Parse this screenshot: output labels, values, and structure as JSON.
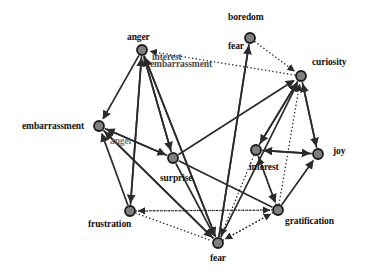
{
  "figure": {
    "type": "directed-graph",
    "title": "",
    "background_color": "#ffffff",
    "node_fill": "#808080",
    "node_stroke": "#1a1a1a",
    "edge_solid_color": "#2b2b2b",
    "edge_dotted_color": "#2b2b2b",
    "node_radius": 5.0
  },
  "nodes": [
    {
      "id": "anger",
      "label": "anger",
      "x": 142,
      "y": 50,
      "label_x": 127,
      "label_y": 33,
      "style": "normal"
    },
    {
      "id": "boredom",
      "label": "boredom",
      "x": 250,
      "y": 38,
      "label_x": 228,
      "label_y": 13,
      "style": "normal"
    },
    {
      "id": "curiosity",
      "label": "curiosity",
      "x": 301,
      "y": 76,
      "label_x": 312,
      "label_y": 58,
      "style": "normal"
    },
    {
      "id": "embarrassment",
      "label": "embarrassment",
      "x": 99,
      "y": 126,
      "label_x": 22,
      "label_y": 122,
      "style": "normal"
    },
    {
      "id": "surprise",
      "label": "surprise",
      "x": 173,
      "y": 158,
      "label_x": 160,
      "label_y": 174,
      "style": "normal"
    },
    {
      "id": "interest",
      "label": "interest",
      "x": 256,
      "y": 150,
      "label_x": 249,
      "label_y": 163,
      "style": "normal"
    },
    {
      "id": "joy",
      "label": "joy",
      "x": 318,
      "y": 154,
      "label_x": 333,
      "label_y": 147,
      "style": "normal"
    },
    {
      "id": "frustration",
      "label": "frustration",
      "x": 130,
      "y": 211,
      "label_x": 88,
      "label_y": 220,
      "style": "normal"
    },
    {
      "id": "gratification",
      "label": "gratification",
      "x": 278,
      "y": 210,
      "label_x": 285,
      "label_y": 217,
      "style": "normal"
    },
    {
      "id": "fear",
      "label": "fear",
      "x": 218,
      "y": 243,
      "label_x": 210,
      "label_y": 254,
      "style": "normal"
    }
  ],
  "overlay_labels": [
    {
      "id": "label-interest-top",
      "text": "interest",
      "x": 152,
      "y": 53,
      "style": "ghost"
    },
    {
      "id": "label-embarrassment-top",
      "text": "embarrassment",
      "x": 150,
      "y": 60,
      "style": "ghost"
    },
    {
      "id": "label-fear-top",
      "text": "fear",
      "x": 228,
      "y": 42,
      "style": "normal"
    },
    {
      "id": "label-anger-mid",
      "text": "anger",
      "x": 110,
      "y": 137,
      "style": "faded"
    }
  ],
  "edges": [
    {
      "from": "anger",
      "to": "embarrassment",
      "style": "solid",
      "arrow": "end"
    },
    {
      "from": "frustration",
      "to": "anger",
      "style": "solid",
      "arrow": "end"
    },
    {
      "from": "fear",
      "to": "anger",
      "style": "solid",
      "arrow": "end"
    },
    {
      "from": "surprise",
      "to": "anger",
      "style": "solid",
      "arrow": "end"
    },
    {
      "from": "curiosity",
      "to": "anger",
      "style": "dotted",
      "arrow": "end"
    },
    {
      "from": "anger",
      "to": "frustration",
      "style": "solid",
      "arrow": "end"
    },
    {
      "from": "anger",
      "to": "fear",
      "style": "solid",
      "arrow": "end"
    },
    {
      "from": "anger",
      "to": "surprise",
      "style": "solid",
      "arrow": "end"
    },
    {
      "from": "boredom",
      "to": "fear",
      "style": "solid",
      "arrow": "none"
    },
    {
      "from": "boredom",
      "to": "curiosity",
      "style": "dotted",
      "arrow": "end"
    },
    {
      "from": "fear",
      "to": "boredom",
      "style": "solid",
      "arrow": "end"
    },
    {
      "from": "gratification",
      "to": "curiosity",
      "style": "dotted",
      "arrow": "end"
    },
    {
      "from": "fear",
      "to": "curiosity",
      "style": "solid",
      "arrow": "end"
    },
    {
      "from": "interest",
      "to": "curiosity",
      "style": "solid",
      "arrow": "end"
    },
    {
      "from": "joy",
      "to": "curiosity",
      "style": "solid",
      "arrow": "end"
    },
    {
      "from": "surprise",
      "to": "curiosity",
      "style": "solid",
      "arrow": "end"
    },
    {
      "from": "embarrassment",
      "to": "surprise",
      "style": "solid",
      "arrow": "end"
    },
    {
      "from": "surprise",
      "to": "embarrassment",
      "style": "solid",
      "arrow": "end"
    },
    {
      "from": "fear",
      "to": "embarrassment",
      "style": "solid",
      "arrow": "end"
    },
    {
      "from": "frustration",
      "to": "embarrassment",
      "style": "solid",
      "arrow": "end"
    },
    {
      "from": "embarrassment",
      "to": "fear",
      "style": "solid",
      "arrow": "end"
    },
    {
      "from": "surprise",
      "to": "fear",
      "style": "solid",
      "arrow": "end"
    },
    {
      "from": "frustration",
      "to": "fear",
      "style": "dotted",
      "arrow": "none"
    },
    {
      "from": "gratification",
      "to": "frustration",
      "style": "dotted",
      "arrow": "end"
    },
    {
      "from": "gratification",
      "to": "fear",
      "style": "dotted",
      "arrow": "end"
    },
    {
      "from": "gratification",
      "to": "joy",
      "style": "solid",
      "arrow": "end"
    },
    {
      "from": "interest",
      "to": "gratification",
      "style": "solid",
      "arrow": "end"
    },
    {
      "from": "interest",
      "to": "joy",
      "style": "solid",
      "arrow": "end"
    },
    {
      "from": "joy",
      "to": "interest",
      "style": "solid",
      "arrow": "end"
    },
    {
      "from": "gratification",
      "to": "interest",
      "style": "dotted",
      "arrow": "end"
    },
    {
      "from": "interest",
      "to": "fear",
      "style": "dotted",
      "arrow": "end"
    },
    {
      "from": "curiosity",
      "to": "joy",
      "style": "solid",
      "arrow": "end"
    },
    {
      "from": "curiosity",
      "to": "interest",
      "style": "solid",
      "arrow": "end"
    },
    {
      "from": "gratification",
      "to": "surprise",
      "style": "solid",
      "arrow": "none"
    },
    {
      "from": "fear",
      "to": "gratification",
      "style": "dotted",
      "arrow": "end"
    },
    {
      "from": "frustration",
      "to": "gratification",
      "style": "dotted",
      "arrow": "end"
    }
  ]
}
